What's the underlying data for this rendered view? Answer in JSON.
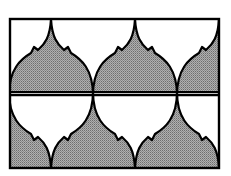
{
  "diagram": {
    "title": "",
    "colors": {
      "shaded": "#9a9a9a",
      "unshaded": "#ffffff",
      "stroke": "#000000"
    },
    "rows": 2,
    "tiles_per_row": 2.5
  }
}
